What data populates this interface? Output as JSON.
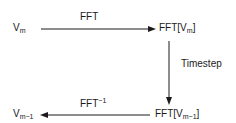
{
  "diagram": {
    "nodes": {
      "top_left": {
        "base": "V",
        "sub": "m"
      },
      "top_right": {
        "prefix": "FFT[",
        "base": "V",
        "sub": "m",
        "suffix": "]"
      },
      "bottom_right": {
        "prefix": "FFT[",
        "base": "V",
        "sub": "m−1",
        "suffix": "]"
      },
      "bottom_left": {
        "base": "V",
        "sub": "m−1"
      }
    },
    "edges": {
      "top": {
        "label": "FFT"
      },
      "right": {
        "label": "Timestep"
      },
      "bottom": {
        "label": "FFT",
        "sup": "−1"
      }
    },
    "colors": {
      "line": "#1a1a1a",
      "text": "#1a1a1a",
      "background": "#ffffff"
    }
  }
}
